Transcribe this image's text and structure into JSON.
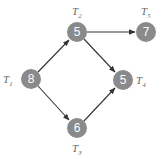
{
  "diagram": {
    "type": "directed-graph",
    "colors": {
      "node_fill": "#8a8a8a",
      "node_text": "#ffffff",
      "edge": "#333333",
      "label": "#6a6a6a"
    },
    "nodes": [
      {
        "id": "T1",
        "label_main": "T",
        "label_sub": "1",
        "value": "8",
        "cx": 31,
        "cy": 79,
        "lx": 4,
        "ly": 83
      },
      {
        "id": "T2",
        "label_main": "T",
        "label_sub": "2",
        "value": "5",
        "cx": 77,
        "cy": 32,
        "lx": 73,
        "ly": 15
      },
      {
        "id": "T3",
        "label_main": "T",
        "label_sub": "3",
        "value": "6",
        "cx": 77,
        "cy": 128,
        "lx": 73,
        "ly": 153
      },
      {
        "id": "T4",
        "label_main": "T",
        "label_sub": "4",
        "value": "5",
        "cx": 123,
        "cy": 80,
        "lx": 137,
        "ly": 85
      },
      {
        "id": "T5",
        "label_main": "T",
        "label_sub": "5",
        "value": "7",
        "cx": 146,
        "cy": 32,
        "lx": 142,
        "ly": 15
      }
    ],
    "edges": [
      {
        "from": "T1",
        "to": "T2"
      },
      {
        "from": "T1",
        "to": "T3"
      },
      {
        "from": "T2",
        "to": "T5"
      },
      {
        "from": "T2",
        "to": "T4"
      },
      {
        "from": "T3",
        "to": "T4"
      }
    ]
  }
}
